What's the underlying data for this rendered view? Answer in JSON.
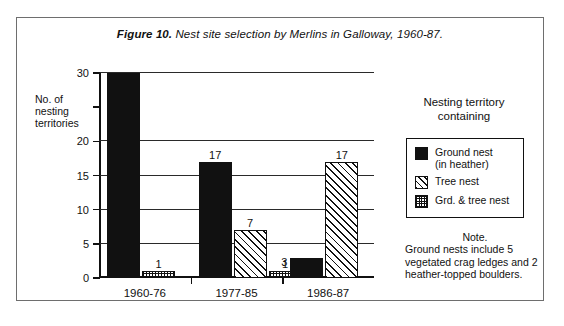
{
  "figure": {
    "number_label": "Figure 10.",
    "title_text": " Nest site selection by Merlins in Galloway, 1960-87."
  },
  "legend": {
    "title_line1": "Nesting territory",
    "title_line2": "containing",
    "items": [
      {
        "label": "Ground nest",
        "sublabel": "(in heather)",
        "pattern": "solid",
        "color": "#111111"
      },
      {
        "label": "Tree nest",
        "sublabel": "",
        "pattern": "hatch",
        "color": "#111111"
      },
      {
        "label": "Grd. & tree nest",
        "sublabel": "",
        "pattern": "stipple",
        "color": "#111111"
      }
    ]
  },
  "note": {
    "heading": "Note.",
    "body": "Ground nests include 5 vegetated crag ledges and 2 heather-topped boulders."
  },
  "axis": {
    "y_title": "No. of nesting territories",
    "y_ticks": [
      {
        "value": 0,
        "label": "0",
        "grid": false
      },
      {
        "value": 5,
        "label": "5",
        "grid": true
      },
      {
        "value": 10,
        "label": "10",
        "grid": true
      },
      {
        "value": 15,
        "label": "15",
        "grid": true
      },
      {
        "value": 20,
        "label": "20",
        "grid": true
      },
      {
        "value": 25,
        "label": "",
        "grid": false
      },
      {
        "value": 30,
        "label": "30",
        "grid": true
      }
    ]
  },
  "chart_data": {
    "type": "bar",
    "title": "Figure 10. Nest site selection by Merlins in Galloway, 1960-87.",
    "xlabel": "",
    "ylabel": "No. of nesting territories",
    "ylim": [
      0,
      30
    ],
    "grid": true,
    "legend_position": "right",
    "categories": [
      "1960-76",
      "1977-85",
      "1986-87"
    ],
    "series": [
      {
        "name": "Ground nest (in heather)",
        "pattern": "solid",
        "values": [
          30,
          17,
          3
        ]
      },
      {
        "name": "Tree nest",
        "pattern": "hatch",
        "values": [
          0,
          7,
          17
        ]
      },
      {
        "name": "Grd. & tree nest",
        "pattern": "stipple",
        "values": [
          1,
          1,
          0
        ]
      }
    ],
    "bar_labels": [
      {
        "category": "1960-76",
        "series": "Ground nest (in heather)",
        "value": 30,
        "label": "",
        "shown": false
      },
      {
        "category": "1960-76",
        "series": "Grd. & tree nest",
        "value": 1,
        "label": "1",
        "shown": true
      },
      {
        "category": "1977-85",
        "series": "Ground nest (in heather)",
        "value": 17,
        "label": "17",
        "shown": true
      },
      {
        "category": "1977-85",
        "series": "Tree nest",
        "value": 7,
        "label": "7",
        "shown": true
      },
      {
        "category": "1977-85",
        "series": "Grd. & tree nest",
        "value": 1,
        "label": "1",
        "shown": true
      },
      {
        "category": "1986-87",
        "series": "Ground nest (in heather)",
        "value": 3,
        "label": "3",
        "shown": true
      },
      {
        "category": "1986-87",
        "series": "Tree nest",
        "value": 17,
        "label": "17",
        "shown": true
      }
    ],
    "annotation": "Note. Ground nests include 5 vegetated crag ledges and 2 heather-topped boulders."
  }
}
